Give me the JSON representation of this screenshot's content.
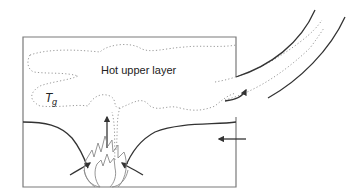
{
  "diagram": {
    "labels": {
      "hot_layer": "Hot upper layer",
      "gas_temp_symbol": "T",
      "gas_temp_subscript": "g"
    },
    "colors": {
      "room_outline": "#7a7a7a",
      "flow_lines": "#333333",
      "smoke_boundary": "#9a9a9a",
      "flame_outline": "#8a8a8a"
    }
  }
}
